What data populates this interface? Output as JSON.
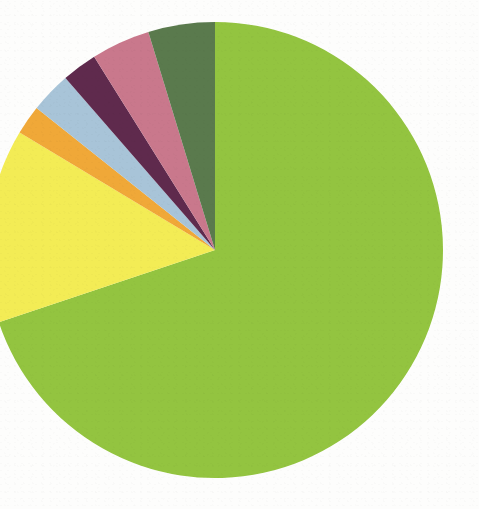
{
  "page": {
    "background_color": "#fdfdfc",
    "width": 479,
    "height": 509
  },
  "chart_data": {
    "type": "pie",
    "title": "",
    "subtitle": "",
    "xlabel": "",
    "ylabel": "",
    "legend_position": "none",
    "grid": false,
    "labels_shown": false,
    "start_angle_deg": 0,
    "direction": "clockwise",
    "center": {
      "cx": 215,
      "cy": 250
    },
    "radius": 228,
    "categories": [
      "Slice 1",
      "Slice 2",
      "Slice 3",
      "Slice 4",
      "Slice 5",
      "Slice 6",
      "Slice 7"
    ],
    "values": [
      69.9,
      13.8,
      2.1,
      2.9,
      2.5,
      4.2,
      4.6
    ],
    "units": "percent",
    "colors": [
      "#93c43f",
      "#f3ec54",
      "#f0a838",
      "#a8c4d8",
      "#5e2a4e",
      "#c9788c",
      "#5a7a4e"
    ],
    "slices": [
      {
        "name": "Slice 1",
        "color": "#93c43f",
        "value": 69.9,
        "start_angle_deg": 0.0,
        "end_angle_deg": 251.5
      },
      {
        "name": "Slice 2",
        "color": "#f3ec54",
        "value": 13.8,
        "start_angle_deg": 251.5,
        "end_angle_deg": 301.0
      },
      {
        "name": "Slice 3",
        "color": "#f0a838",
        "value": 2.1,
        "start_angle_deg": 301.0,
        "end_angle_deg": 308.5
      },
      {
        "name": "Slice 4",
        "color": "#a8c4d8",
        "value": 2.9,
        "start_angle_deg": 308.5,
        "end_angle_deg": 319.0
      },
      {
        "name": "Slice 5",
        "color": "#5e2a4e",
        "value": 2.5,
        "start_angle_deg": 319.0,
        "end_angle_deg": 328.0
      },
      {
        "name": "Slice 6",
        "color": "#c9788c",
        "value": 4.2,
        "start_angle_deg": 328.0,
        "end_angle_deg": 343.0
      },
      {
        "name": "Slice 7",
        "color": "#5a7a4e",
        "value": 4.6,
        "start_angle_deg": 343.0,
        "end_angle_deg": 360.0
      }
    ]
  }
}
